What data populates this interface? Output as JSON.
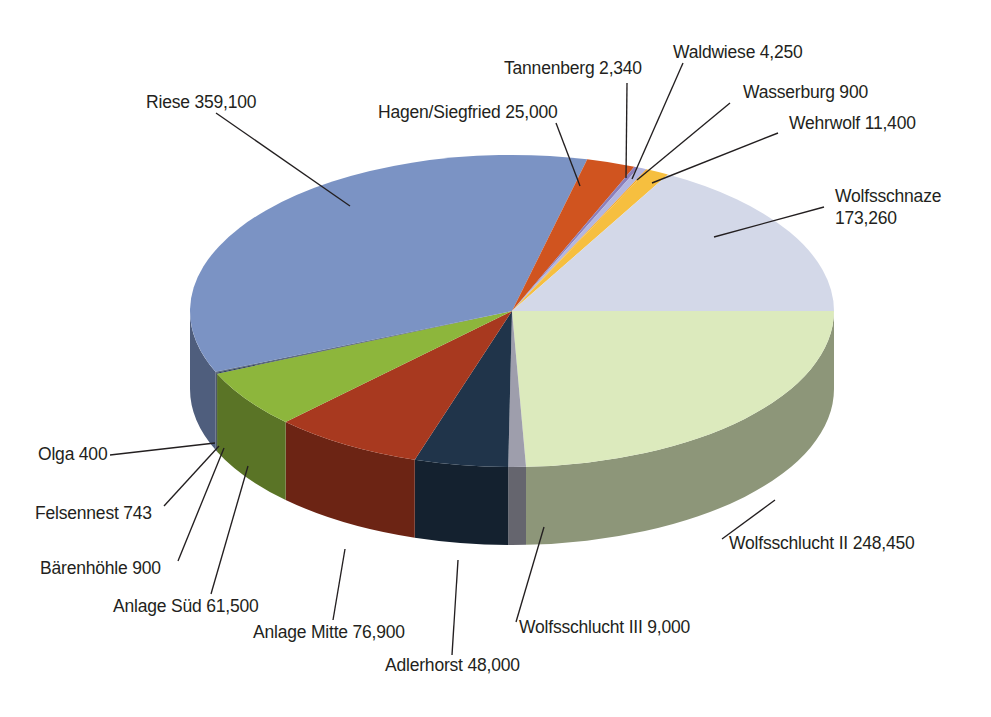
{
  "chart_data": {
    "type": "pie",
    "title": "",
    "subtitle": "",
    "xlabel": "",
    "ylabel": "",
    "legend_position": "none",
    "grid": false,
    "three_d": true,
    "value_format": "comma-separated integers",
    "total": 1021143,
    "categories": [
      "Wolfsschlucht II",
      "Wolfsschlucht III",
      "Adlerhorst",
      "Anlage Mitte",
      "Anlage Süd",
      "Bärenhöhle",
      "Felsennest",
      "Olga",
      "Riese",
      "Hagen/Siegfried",
      "Tannenberg",
      "Waldwiese",
      "Wasserburg",
      "Wehrwolf",
      "Wolfsschnaze"
    ],
    "values": [
      248450,
      9000,
      48000,
      76900,
      61500,
      900,
      743,
      400,
      359100,
      25000,
      2340,
      4250,
      900,
      11400,
      173260
    ],
    "colors": [
      "#dceabd",
      "#9e9eac",
      "#20344a",
      "#a8391f",
      "#8db63c",
      "#2c3e5a",
      "#2c3e5a",
      "#2c3e5a",
      "#7b93c4",
      "#d0541f",
      "#8c7fbb",
      "#b3b6e0",
      "#f5a623",
      "#f6bf3f",
      "#d3d8e8"
    ],
    "slices": [
      {
        "label": "Wolfsschlucht II",
        "value": 248450,
        "display": "Wolfsschlucht II 248,450",
        "color": "#dceabd"
      },
      {
        "label": "Wolfsschlucht III",
        "value": 9000,
        "display": "Wolfsschlucht III 9,000",
        "color": "#9e9eac"
      },
      {
        "label": "Adlerhorst",
        "value": 48000,
        "display": "Adlerhorst 48,000",
        "color": "#20344a"
      },
      {
        "label": "Anlage Mitte",
        "value": 76900,
        "display": "Anlage Mitte 76,900",
        "color": "#a8391f"
      },
      {
        "label": "Anlage Süd",
        "value": 61500,
        "display": "Anlage Süd 61,500",
        "color": "#8db63c"
      },
      {
        "label": "Bärenhöhle",
        "value": 900,
        "display": "Bärenhöhle 900",
        "color": "#2c3e5a"
      },
      {
        "label": "Felsennest",
        "value": 743,
        "display": "Felsennest 743",
        "color": "#2c3e5a"
      },
      {
        "label": "Olga",
        "value": 400,
        "display": "Olga 400",
        "color": "#2c3e5a"
      },
      {
        "label": "Riese",
        "value": 359100,
        "display": "Riese 359,100",
        "color": "#7b93c4"
      },
      {
        "label": "Hagen/Siegfried",
        "value": 25000,
        "display": "Hagen/Siegfried 25,000",
        "color": "#d0541f"
      },
      {
        "label": "Tannenberg",
        "value": 2340,
        "display": "Tannenberg 2,340",
        "color": "#8c7fbb"
      },
      {
        "label": "Waldwiese",
        "value": 4250,
        "display": "Waldwiese 4,250",
        "color": "#b3b6e0"
      },
      {
        "label": "Wasserburg",
        "value": 900,
        "display": "Wasserburg 900",
        "color": "#f5a623"
      },
      {
        "label": "Wehrwolf",
        "value": 11400,
        "display": "Wehrwolf 11,400",
        "color": "#f6bf3f"
      },
      {
        "label": "Wolfsschnaze",
        "value": 173260,
        "display": "Wolfsschnaze",
        "display2": "173,260",
        "color": "#d3d8e8"
      }
    ]
  },
  "labels": {
    "riese": "Riese 359,100",
    "hagen_siegfried": "Hagen/Siegfried 25,000",
    "tannenberg": "Tannenberg 2,340",
    "waldwiese": "Waldwiese 4,250",
    "wasserburg": "Wasserburg 900",
    "wehrwolf": "Wehrwolf 11,400",
    "wolfsschnaze_line1": "Wolfsschnaze",
    "wolfsschnaze_line2": "173,260",
    "wolfsschlucht2": "Wolfsschlucht II 248,450",
    "wolfsschlucht3": "Wolfsschlucht III 9,000",
    "adlerhorst": "Adlerhorst 48,000",
    "anlage_mitte": "Anlage Mitte 76,900",
    "anlage_sued": "Anlage Süd 61,500",
    "baerenhoehle": "Bärenhöhle 900",
    "felsennest": "Felsennest 743",
    "olga": "Olga 400"
  }
}
